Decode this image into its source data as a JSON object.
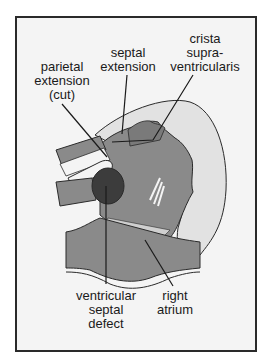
{
  "figure": {
    "labels": {
      "crista": "crista\nsupra-\nventricularis",
      "septal": "septal\nextension",
      "parietal": "parietal\nextension\n(cut)",
      "vsd": "ventricular\nseptal\ndefect",
      "atrium": "right\natrium"
    },
    "colors": {
      "frame_border": "#2a2a2a",
      "background": "#f4f4f4",
      "outer_shell": "#e2e2e2",
      "tissue": "#8a8a8a",
      "tissue_dark": "#6e6e6e",
      "defect": "#3c3c3c",
      "outline": "#2a2a2a"
    }
  }
}
